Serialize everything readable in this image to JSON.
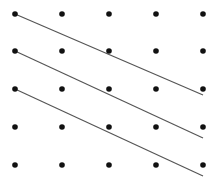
{
  "diagram": {
    "width": 220,
    "height": 183,
    "background": "#ffffff",
    "dot_color": "#111111",
    "line_color": "#555555",
    "dot_radius": 2.8,
    "line_width": 1.2,
    "grid": {
      "columns_x": [
        15,
        62,
        109,
        156,
        203
      ],
      "rows_y": [
        14,
        51,
        89,
        127,
        165
      ]
    },
    "lines": [
      {
        "x1": 15,
        "y1": 14,
        "x2": 203,
        "y2": 95
      },
      {
        "x1": 15,
        "y1": 51,
        "x2": 203,
        "y2": 138
      },
      {
        "x1": 15,
        "y1": 89,
        "x2": 203,
        "y2": 176
      }
    ]
  }
}
